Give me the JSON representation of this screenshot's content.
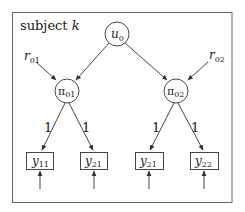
{
  "diagram": {
    "type": "path-diagram",
    "frame_label": {
      "text": "subject ",
      "var": "k"
    },
    "latent_top": {
      "id": "u0",
      "base": "u",
      "sub": "0"
    },
    "latent_mid": [
      {
        "id": "pi01",
        "base": "π",
        "sub": "01",
        "disturbance": {
          "base": "r",
          "sub": "01"
        }
      },
      {
        "id": "pi02",
        "base": "π",
        "sub": "02",
        "disturbance": {
          "base": "r",
          "sub": "02"
        }
      }
    ],
    "observed": [
      {
        "id": "y11",
        "base": "y",
        "sub": "11",
        "parent": "pi01",
        "loading": "1"
      },
      {
        "id": "y21a",
        "base": "y",
        "sub": "21",
        "parent": "pi01",
        "loading": "1"
      },
      {
        "id": "y21b",
        "base": "y",
        "sub": "21",
        "parent": "pi02",
        "loading": "1"
      },
      {
        "id": "y22",
        "base": "y",
        "sub": "22",
        "parent": "pi02",
        "loading": "1"
      }
    ],
    "edges": [
      {
        "from": "u0",
        "to": "pi01"
      },
      {
        "from": "u0",
        "to": "pi02"
      },
      {
        "from": "r01",
        "to": "pi01"
      },
      {
        "from": "r02",
        "to": "pi02"
      },
      {
        "from": "pi01",
        "to": "y11",
        "label": "1"
      },
      {
        "from": "pi01",
        "to": "y21a",
        "label": "1"
      },
      {
        "from": "pi02",
        "to": "y21b",
        "label": "1"
      },
      {
        "from": "pi02",
        "to": "y22",
        "label": "1"
      },
      {
        "from": "error",
        "to": "y11"
      },
      {
        "from": "error",
        "to": "y21a"
      },
      {
        "from": "error",
        "to": "y21b"
      },
      {
        "from": "error",
        "to": "y22"
      }
    ]
  },
  "colors": {
    "stroke": "#333333",
    "text": "#222222",
    "frame": "#666666",
    "background": "#ffffff"
  }
}
